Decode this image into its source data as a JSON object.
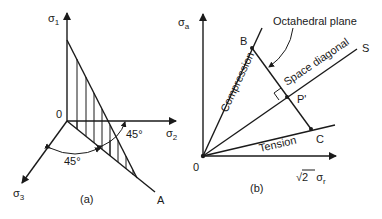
{
  "figure_a": {
    "caption": "(a)",
    "axes": {
      "sigma1": {
        "symbol": "σ",
        "subscript": "1"
      },
      "sigma2": {
        "symbol": "σ",
        "subscript": "2"
      },
      "sigma3": {
        "symbol": "σ",
        "subscript": "3"
      }
    },
    "origin_label": "0",
    "point_label_A": "A",
    "angle_lower": "45°",
    "angle_right": "45°"
  },
  "figure_b": {
    "caption": "(b)",
    "axes": {
      "vertical": {
        "symbol": "σ",
        "subscript": "a"
      },
      "horizontal": {
        "prefix": "√2",
        "symbol": "σ",
        "subscript": "r"
      }
    },
    "origin_label": "0",
    "point_B": "B",
    "point_C": "C",
    "point_P": "P'",
    "point_S": "S",
    "line_compression": "Compression",
    "line_tension": "Tension",
    "line_space_diagonal": "Space diagonal",
    "octahedral_plane_label": "Octahedral plane"
  }
}
